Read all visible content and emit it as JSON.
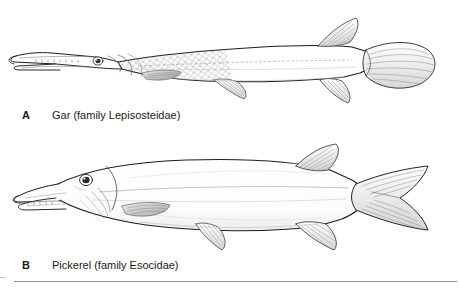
{
  "figure": {
    "background_color": "#ffffff",
    "ink_color": "#1a1a1a",
    "rule_color": "#8f8f8f"
  },
  "panels": [
    {
      "letter": "A",
      "caption": "Gar (family Lepisosteidae)",
      "subject": "gar-fish-illustration",
      "features": {
        "snout": "long narrow beak-like jaws with small teeth",
        "scales": "diamond-shaped ganoid scales on forebody",
        "tail": "rounded fan-shaped caudal fin",
        "fins": "dorsal and anal fins set far back near tail"
      }
    },
    {
      "letter": "B",
      "caption": "Pickerel (family Esocidae)",
      "subject": "pickerel-fish-illustration",
      "features": {
        "snout": "broad duck-bill shaped jaws with teeth",
        "scales": "smooth fine-stippled body",
        "tail": "deeply forked caudal fin",
        "fins": "dorsal and anal fins set far back near tail"
      }
    }
  ]
}
